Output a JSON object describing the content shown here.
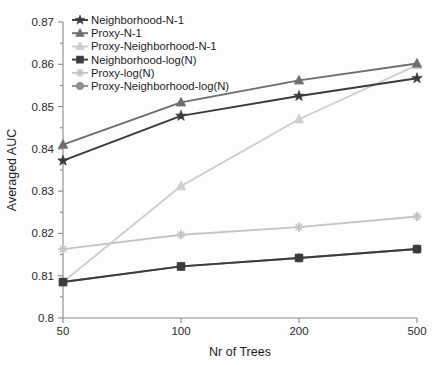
{
  "chart_data": {
    "type": "line",
    "title": "",
    "xlabel": "Nr of Trees",
    "ylabel": "Averaged AUC",
    "x": [
      "50",
      "100",
      "200",
      "500"
    ],
    "xtick_labels": [
      "50",
      "100",
      "200",
      "500"
    ],
    "ytick_labels": [
      "0.8",
      "0.81",
      "0.82",
      "0.83",
      "0.84",
      "0.85",
      "0.86",
      "0.87"
    ],
    "ylim": [
      0.8,
      0.87
    ],
    "ytick_values": [
      0.8,
      0.81,
      0.82,
      0.83,
      0.84,
      0.85,
      0.86,
      0.87
    ],
    "grid": false,
    "legend_position": "upper-left",
    "series": [
      {
        "name": "Neighborhood-N-1",
        "values": [
          0.8372,
          0.8478,
          0.8525,
          0.8567
        ],
        "color": "#3b3b3b",
        "marker": "star"
      },
      {
        "name": "Proxy-N-1",
        "values": [
          0.841,
          0.851,
          0.8562,
          0.8602
        ],
        "color": "#6e6e6e",
        "marker": "triangle"
      },
      {
        "name": "Proxy-Neighborhood-N-1",
        "values": [
          0.8085,
          0.8312,
          0.847,
          0.8598
        ],
        "color": "#cfcfcf",
        "marker": "triangle"
      },
      {
        "name": "Neighborhood-log(N)",
        "values": [
          0.8085,
          0.8122,
          0.8142,
          0.8163
        ],
        "color": "#3b3b3b",
        "marker": "square"
      },
      {
        "name": "Proxy-log(N)",
        "values": [
          0.8163,
          0.8197,
          0.8215,
          0.824
        ],
        "color": "#c4c4c4",
        "marker": "plus"
      },
      {
        "name": "Proxy-Neighborhood-log(N)",
        "values": [
          0.8085,
          0.8122,
          0.8142,
          0.8163
        ],
        "color": "#8f8f8f",
        "marker": "circle"
      }
    ]
  },
  "axes": {
    "ylabel": "Averaged AUC",
    "xlabel": "Nr of Trees"
  }
}
